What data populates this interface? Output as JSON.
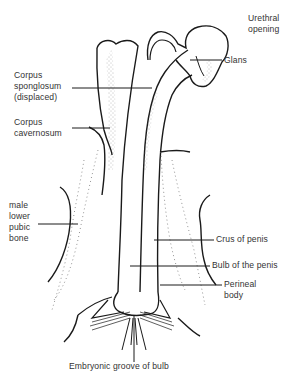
{
  "diagram": {
    "colors": {
      "ink": "#1a1a1a",
      "text": "#333333",
      "stipple": "#6a6a6a",
      "background": "#ffffff"
    },
    "labels": {
      "urethral_opening": "Urethral\nopening",
      "glans": "Glans",
      "corpus_spongiosum": "Corpus\nsponglosum\n(displaced)",
      "corpus_cavernosum": "Corpus\ncavernosum",
      "pubic_bone": "male\nlower\npubic\nbone",
      "crus_of_penis": "Crus of penis",
      "bulb_of_penis": "Bulb of the penis",
      "perineal_body": "Perineal\nbody",
      "embryonic_groove": "Embryonic groove of bulb"
    }
  }
}
